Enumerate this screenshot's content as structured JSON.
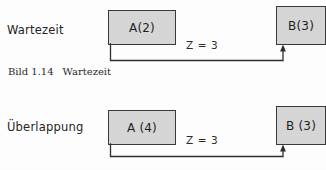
{
  "figure": {
    "caption_number": "Bild 1.14",
    "caption_title": "Wartezeit",
    "background_color": "#fefefe",
    "box_fill_color": "#d6d6d6",
    "box_border_color": "#3a3a3a",
    "line_color": "#2e2e2e"
  },
  "rows": [
    {
      "label": "Wartezeit",
      "predecessor": {
        "text": "A(2)",
        "name": "A",
        "duration": "2"
      },
      "successor": {
        "text": "B(3)",
        "name": "B",
        "duration": "3"
      },
      "relation": {
        "label": "Z = 3",
        "symbol": "Z",
        "value": "3"
      }
    },
    {
      "label": "Überlappung",
      "predecessor": {
        "text": "A (4)",
        "name": "A",
        "duration": "4"
      },
      "successor": {
        "text": "B (3)",
        "name": "B",
        "duration": "3"
      },
      "relation": {
        "label": "Z = 3",
        "symbol": "Z",
        "value": "3"
      }
    }
  ]
}
